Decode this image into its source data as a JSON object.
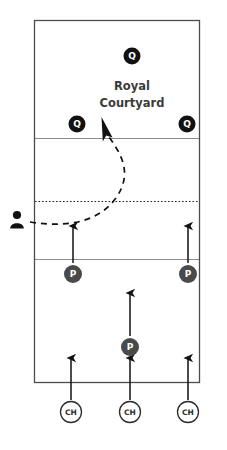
{
  "diagram": {
    "type": "tactical-formation-map",
    "background_color": "#ffffff",
    "field": {
      "name": "field-outline",
      "border_color": "#4d4d4d",
      "x": 34,
      "y": 20,
      "width": 166,
      "height": 363,
      "divider_lines": [
        {
          "name": "divider-upper",
          "y": 138,
          "color": "#8c8c8c",
          "style": "solid"
        },
        {
          "name": "divider-mid-dotted",
          "y": 201,
          "color": "#222222",
          "style": "dotted"
        },
        {
          "name": "divider-lower",
          "y": 259,
          "color": "#8c8c8c",
          "style": "solid"
        }
      ]
    },
    "zone_title": {
      "line1": "Royal",
      "line2": "Courtyard",
      "color": "#3b3b3b",
      "x": 132,
      "y1": 86,
      "y2": 103,
      "font_size": 11.5
    },
    "units": [
      {
        "id": "q-top",
        "label": "Q",
        "kind": "queen",
        "x": 132,
        "y": 56,
        "r": 8.5,
        "fill": "#111111",
        "text_color": "#ffffff",
        "stroke": "none",
        "font_size": 9
      },
      {
        "id": "q-left",
        "label": "Q",
        "kind": "queen",
        "x": 77,
        "y": 124,
        "r": 8.5,
        "fill": "#111111",
        "text_color": "#ffffff",
        "stroke": "none",
        "font_size": 9
      },
      {
        "id": "q-right",
        "label": "Q",
        "kind": "queen",
        "x": 187,
        "y": 124,
        "r": 8.5,
        "fill": "#111111",
        "text_color": "#ffffff",
        "stroke": "none",
        "font_size": 9
      },
      {
        "id": "p-left",
        "label": "P",
        "kind": "pawn",
        "x": 73,
        "y": 274,
        "r": 9.0,
        "fill": "#4a4a4a",
        "text_color": "#ffffff",
        "stroke": "none",
        "font_size": 9
      },
      {
        "id": "p-right",
        "label": "P",
        "kind": "pawn",
        "x": 188,
        "y": 274,
        "r": 9.0,
        "fill": "#4a4a4a",
        "text_color": "#ffffff",
        "stroke": "none",
        "font_size": 9
      },
      {
        "id": "p-center",
        "label": "P",
        "kind": "pawn",
        "x": 130,
        "y": 347,
        "r": 9.0,
        "fill": "#4a4a4a",
        "text_color": "#ffffff",
        "stroke": "none",
        "font_size": 9
      },
      {
        "id": "ch-left",
        "label": "CH",
        "kind": "chariot",
        "x": 71,
        "y": 412,
        "r": 10.5,
        "fill": "#ffffff",
        "text_color": "#2b2b2b",
        "stroke": "#2b2b2b",
        "font_size": 7.5
      },
      {
        "id": "ch-mid",
        "label": "CH",
        "kind": "chariot",
        "x": 130,
        "y": 412,
        "r": 10.5,
        "fill": "#ffffff",
        "text_color": "#2b2b2b",
        "stroke": "#2b2b2b",
        "font_size": 7.5
      },
      {
        "id": "ch-right",
        "label": "CH",
        "kind": "chariot",
        "x": 188,
        "y": 412,
        "r": 10.5,
        "fill": "#ffffff",
        "text_color": "#2b2b2b",
        "stroke": "#2b2b2b",
        "font_size": 7.5
      }
    ],
    "movement_arrows": [
      {
        "name": "arrow-p-left-advance",
        "x1": 73,
        "y1": 263,
        "x2": 73,
        "y2": 226,
        "color": "#111111"
      },
      {
        "name": "arrow-p-right-advance",
        "x1": 188,
        "y1": 263,
        "x2": 188,
        "y2": 226,
        "color": "#111111"
      },
      {
        "name": "arrow-p-center-advance",
        "x1": 130,
        "y1": 336,
        "x2": 130,
        "y2": 293,
        "color": "#111111"
      },
      {
        "name": "arrow-ch-left-advance",
        "x1": 71,
        "y1": 400,
        "x2": 71,
        "y2": 358,
        "color": "#111111"
      },
      {
        "name": "arrow-ch-mid-advance",
        "x1": 130,
        "y1": 400,
        "x2": 130,
        "y2": 358,
        "color": "#111111"
      },
      {
        "name": "arrow-ch-right-advance",
        "x1": 188,
        "y1": 400,
        "x2": 188,
        "y2": 358,
        "color": "#111111"
      }
    ],
    "infiltration_path": {
      "name": "dashed-infiltration-route",
      "color": "#111111",
      "dash": "6 5",
      "path": "M 30 222 C 62 227, 96 225, 116 198 C 134 172, 120 152, 106 133",
      "arrow_tip": {
        "x": 104,
        "y": 128
      }
    },
    "actor_icon": {
      "name": "person-icon",
      "label": "person",
      "x": 17,
      "y": 221,
      "color": "#111111"
    },
    "colors": {
      "queen_marker": "#111111",
      "pawn_marker": "#4a4a4a",
      "chariot_marker": "#ffffff",
      "chariot_outline": "#2b2b2b",
      "field_border": "#4d4d4d",
      "divider": "#8c8c8c",
      "title_text": "#3b3b3b"
    }
  }
}
